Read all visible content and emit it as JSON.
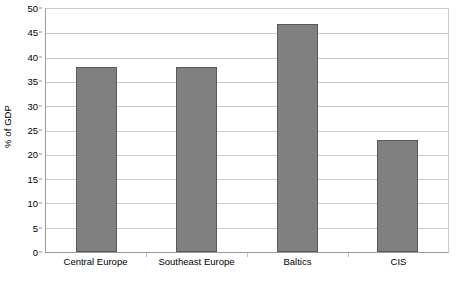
{
  "chart_data": {
    "type": "bar",
    "title": "",
    "subtitle": "",
    "xlabel": "",
    "ylabel": "% of GDP",
    "categories": [
      "Central Europe",
      "Southeast Europe",
      "Baltics",
      "CIS"
    ],
    "values": [
      38,
      38,
      47,
      23
    ],
    "ylim": [
      0,
      50
    ],
    "ytick_step": 5,
    "yticks": [
      0,
      5,
      10,
      15,
      20,
      25,
      30,
      35,
      40,
      45,
      50
    ],
    "ytick_labels": [
      "0",
      "5",
      "10",
      "15",
      "20",
      "25",
      "30",
      "35",
      "40",
      "45",
      "50"
    ],
    "grid": true,
    "grid_axis": "y",
    "legend": false,
    "legend_position": "none",
    "annotations": [],
    "colors": {
      "bar_fill": "#808080",
      "bar_border": "#595959",
      "gridline": "#c9c9c9",
      "axis": "#9a9a9a",
      "text": "#000000",
      "background": "#ffffff"
    }
  }
}
